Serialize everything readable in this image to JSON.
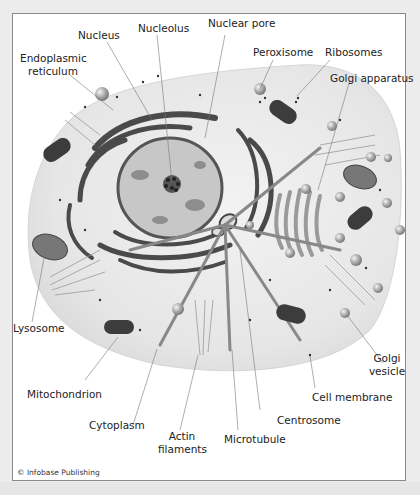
{
  "figure": {
    "type": "labeled cell diagram (animal cell)",
    "credit": "© Infobase Publishing",
    "colors": {
      "cell_fill": "#e9e9e9",
      "nucleus_fill": "#c9c9c9",
      "organelle_dark": "#3c3c3c",
      "background": "#ffffff",
      "page_bg": "#ececec"
    }
  },
  "labels": {
    "nucleus": "Nucleus",
    "nucleolus": "Nucleolus",
    "nuclear_pore": "Nuclear pore",
    "er_line1": "Endoplasmic",
    "er_line2": "reticulum",
    "peroxisome": "Peroxisome",
    "ribosomes": "Ribosomes",
    "golgi_apparatus": "Golgi apparatus",
    "lysosome": "Lysosome",
    "golgi_vesicle_line1": "Golgi",
    "golgi_vesicle_line2": "vesicle",
    "mitochondrion": "Mitochondrion",
    "cell_membrane": "Cell membrane",
    "cytoplasm": "Cytoplasm",
    "centrosome": "Centrosome",
    "actin_line1": "Actin",
    "actin_line2": "filaments",
    "microtubule": "Microtubule"
  }
}
